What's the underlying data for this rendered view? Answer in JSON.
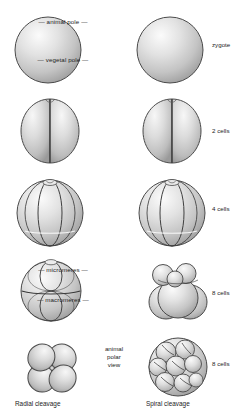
{
  "figure": {
    "title_visible": false,
    "background": "#ffffff",
    "ink": "#1c1c1c",
    "cell_fill_light": "#f2f2f2",
    "cell_fill_mid": "#cfcfcf",
    "cell_fill_dark": "#9a9a9a",
    "cell_outline": "#4a4a4a"
  },
  "center_labels": {
    "animal_pole": "— animal pole —",
    "vegetal_pole": "— vegetal pole —",
    "micromeres": "— micromeres —",
    "macromeres": "— macromeres —",
    "polar_view_line1": "animal",
    "polar_view_line2": "polar",
    "polar_view_line3": "view"
  },
  "stage_labels": {
    "row1": "zygote",
    "row2": "2 cells",
    "row3": "4 cells",
    "row4": "8 cells",
    "row5": "8 cells"
  },
  "captions": {
    "left": "Radial cleavage",
    "right": "Spiral cleavage"
  },
  "columns": [
    {
      "name": "radial",
      "caption": "Radial cleavage"
    },
    {
      "name": "spiral",
      "caption": "Spiral cleavage"
    }
  ],
  "rows": [
    {
      "stage": "zygote",
      "cells": 1,
      "view": "lateral"
    },
    {
      "stage": "2 cells",
      "cells": 2,
      "view": "lateral"
    },
    {
      "stage": "4 cells",
      "cells": 4,
      "view": "lateral"
    },
    {
      "stage": "8 cells",
      "cells": 8,
      "view": "lateral"
    },
    {
      "stage": "8 cells",
      "cells": 8,
      "view": "animal polar view"
    }
  ]
}
